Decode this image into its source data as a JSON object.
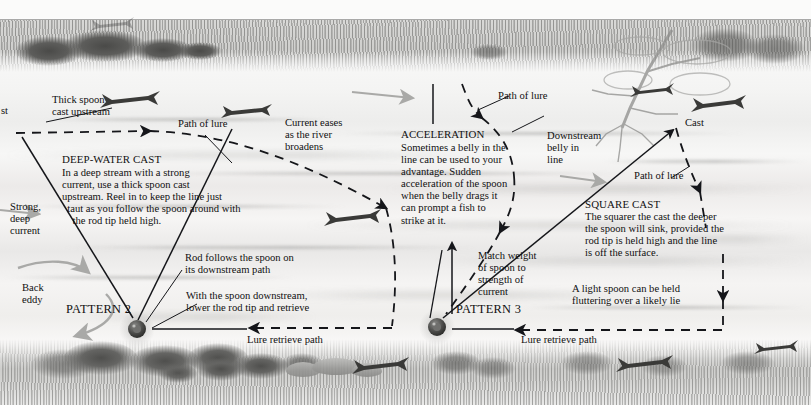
{
  "figure": {
    "scene": "river seen from above with grassy banks top and bottom"
  },
  "labels": {
    "cut_left": "st",
    "thick_spoon": "Thick spoon\ncast upstream",
    "path_of_lure_1": "Path of lure",
    "current_eases": "Current eases\nas the river\nbroadens",
    "path_of_lure_2": "Path of lure",
    "downstream_belly": "Downstream\nbelly in\nline",
    "cast": "Cast",
    "path_of_lure_3": "Path of lure",
    "strong_deep_current": "Strong,\ndeep\ncurrent",
    "back_eddy": "Back\neddy",
    "rod_follows": "Rod follows the spoon on\nits downstream path",
    "with_spoon_downstream": "With the spoon downstream,\nlower the rod tip and retrieve",
    "match_weight": "Match weight\nof spoon to\nstrength of\ncurrent",
    "light_spoon": "A light spoon can be held\nfluttering over a likely lie",
    "lure_retrieve_left": "Lure retrieve path",
    "lure_retrieve_right": "Lure retrieve path",
    "pattern_2": "PATTERN 2",
    "pattern_3": "PATTERN 3"
  },
  "blocks": {
    "deep_water_cast": {
      "heading": "DEEP-WATER CAST",
      "body": "In a deep stream with a strong\ncurrent, use a thick spoon cast\nupstream. Reel in to keep the line just\n  taut as you follow the spoon around with\n    the rod tip held high."
    },
    "acceleration": {
      "heading": "ACCELERATION",
      "body": "Sometimes a belly in the\nline can be used to your\nadvantage. Sudden\nacceleration of the spoon\nwhen the belly drags it\ncan prompt a fish to\nstrike at it."
    },
    "square_cast": {
      "heading": "SQUARE CAST",
      "body": "The squarer the cast the deeper\nthe spoon will sink, provided the\nrod tip is held high and the line\nis off the surface."
    }
  },
  "colors": {
    "ink": "#101010",
    "line": "#15161a",
    "current_arrow": "#a9a9a7",
    "water_light": "#f6f6f5",
    "bank_dark": "#55554f"
  },
  "icons": {
    "reel_left": "fishing-reel-icon",
    "reel_right": "fishing-reel-icon",
    "fish": "fish-silhouette-icon",
    "eddy": "curved-current-arrow-icon"
  }
}
